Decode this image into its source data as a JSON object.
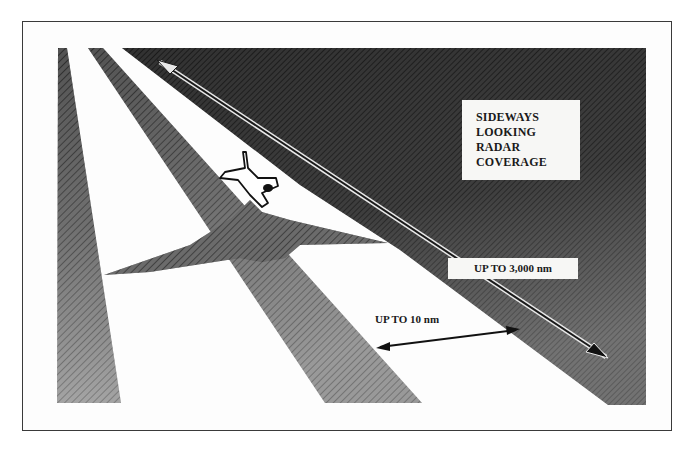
{
  "diagram": {
    "title_lines": [
      "SIDEWAYS",
      "LOOKING",
      "RADAR",
      "COVERAGE"
    ],
    "long_range_label": "UP TO 3,000 nm",
    "short_range_label": "UP TO 10 nm",
    "elements": [
      {
        "type": "aircraft",
        "name": "aircraft-icon"
      },
      {
        "type": "radar-beam",
        "name": "left-beam"
      },
      {
        "type": "radar-beam",
        "name": "center-beam"
      },
      {
        "type": "radar-wedge",
        "name": "long-range-coverage-wedge"
      },
      {
        "type": "aircraft-shadow",
        "name": "aircraft-shadow"
      },
      {
        "type": "arrow",
        "name": "long-range-arrow",
        "label_ref": "long_range_label"
      },
      {
        "type": "arrow",
        "name": "short-range-arrow",
        "label_ref": "short_range_label"
      }
    ],
    "colors": {
      "dark_fill": "#1c1c1c",
      "mid_fill": "#5a5a5a",
      "background": "#fdfdfd",
      "border": "#3a3a3a"
    }
  }
}
